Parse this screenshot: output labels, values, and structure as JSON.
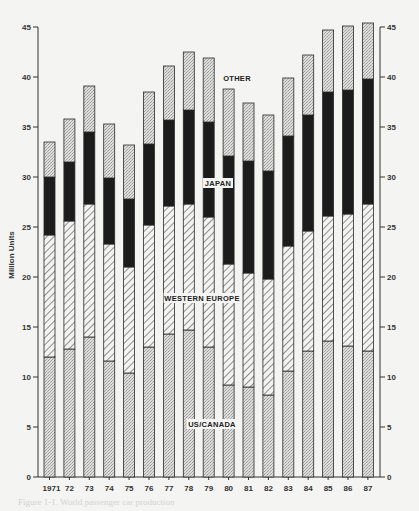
{
  "chart_data": {
    "type": "bar",
    "stacked": true,
    "title": "",
    "xlabel": "",
    "ylabel": "Million Units",
    "ylim": [
      0,
      45
    ],
    "yticks": [
      0,
      5,
      10,
      15,
      20,
      25,
      30,
      35,
      40,
      45
    ],
    "grid": false,
    "legend_position": "inline labels on bars",
    "categories": [
      "1971",
      "72",
      "73",
      "74",
      "75",
      "76",
      "77",
      "78",
      "79",
      "80",
      "81",
      "82",
      "83",
      "84",
      "85",
      "86",
      "87"
    ],
    "series": [
      {
        "name": "US/CANADA",
        "pattern": "stipple-light",
        "values": [
          12.0,
          12.8,
          14.0,
          11.6,
          10.4,
          13.0,
          14.3,
          14.7,
          13.0,
          9.2,
          9.0,
          8.2,
          10.6,
          12.6,
          13.6,
          13.1,
          12.6
        ]
      },
      {
        "name": "WESTERN EUROPE",
        "pattern": "diagonal-hatch",
        "values": [
          12.2,
          12.8,
          13.3,
          11.7,
          10.6,
          12.2,
          12.8,
          12.6,
          13.0,
          12.1,
          11.4,
          11.6,
          12.5,
          12.0,
          12.5,
          13.2,
          14.7
        ]
      },
      {
        "name": "JAPAN",
        "pattern": "solid-black",
        "values": [
          5.8,
          5.9,
          7.2,
          6.6,
          6.8,
          8.1,
          8.6,
          9.4,
          9.5,
          10.8,
          11.2,
          10.8,
          11.0,
          11.6,
          12.4,
          12.4,
          12.5
        ]
      },
      {
        "name": "OTHER",
        "pattern": "stipple-light",
        "values": [
          3.5,
          4.3,
          4.6,
          5.4,
          5.4,
          5.2,
          5.4,
          5.8,
          6.4,
          6.7,
          5.8,
          5.6,
          5.8,
          6.0,
          6.2,
          6.4,
          5.6
        ]
      }
    ],
    "totals": [
      33.5,
      35.8,
      39.1,
      35.3,
      33.2,
      38.5,
      41.1,
      42.5,
      41.9,
      38.8,
      37.4,
      36.2,
      39.9,
      42.2,
      44.7,
      45.1,
      45.4
    ],
    "annotations": [
      "OTHER",
      "JAPAN",
      "WESTERN EUROPE",
      "US/CANADA"
    ],
    "right_axis_duplicate": true
  },
  "labels": {
    "ylabel": "Million Units",
    "other": "OTHER",
    "japan": "JAPAN",
    "western_europe": "WESTERN EUROPE",
    "us_canada": "US/CANADA"
  },
  "colors": {
    "stipple": "#d2d2d0",
    "hatch_bg": "#f2f2f0",
    "hatch_line": "#444444",
    "japan": "#1c1c1c",
    "axis": "#333333"
  },
  "caption": "Figure 1-1. World passenger car production"
}
